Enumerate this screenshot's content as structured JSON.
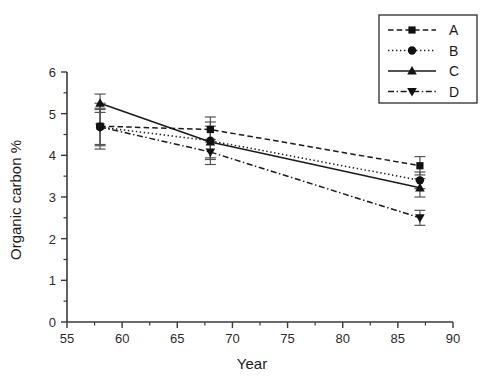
{
  "chart_data": {
    "type": "line",
    "title": "",
    "xlabel": "Year",
    "ylabel": "Organic carbon %",
    "xlim": [
      55,
      90
    ],
    "ylim": [
      0,
      6
    ],
    "xticks": [
      55,
      60,
      65,
      70,
      75,
      80,
      85,
      90
    ],
    "xtick_labels": [
      "55",
      "60",
      "65",
      "70",
      "75",
      "80",
      "85",
      "90"
    ],
    "xminor_step": 2.5,
    "yticks": [
      0,
      1,
      2,
      3,
      4,
      5,
      6
    ],
    "ytick_labels": [
      "0",
      "1",
      "2",
      "3",
      "4",
      "5",
      "6"
    ],
    "yminor_step": 0.5,
    "grid": false,
    "legend_position": "top-right",
    "x": [
      58,
      68,
      87
    ],
    "series": [
      {
        "name": "A",
        "label": "A",
        "marker": "square",
        "linestyle": "dashed",
        "color": "#1a1a1a",
        "values": [
          4.7,
          4.62,
          3.75
        ],
        "errors": [
          0.55,
          0.3,
          0.22
        ]
      },
      {
        "name": "B",
        "label": "B",
        "marker": "circle",
        "linestyle": "dotted",
        "color": "#1a1a1a",
        "values": [
          4.68,
          4.35,
          3.4
        ],
        "errors": [
          0.42,
          0.45,
          0.2
        ]
      },
      {
        "name": "C",
        "label": "C",
        "marker": "triangle-up",
        "linestyle": "solid",
        "color": "#1a1a1a",
        "values": [
          5.25,
          4.32,
          3.22
        ],
        "errors": [
          0.22,
          0.38,
          0.22
        ]
      },
      {
        "name": "D",
        "label": "D",
        "marker": "triangle-down",
        "linestyle": "dashdot",
        "color": "#1a1a1a",
        "values": [
          4.68,
          4.08,
          2.5
        ],
        "errors": [
          0.45,
          0.3,
          0.18
        ]
      }
    ]
  }
}
